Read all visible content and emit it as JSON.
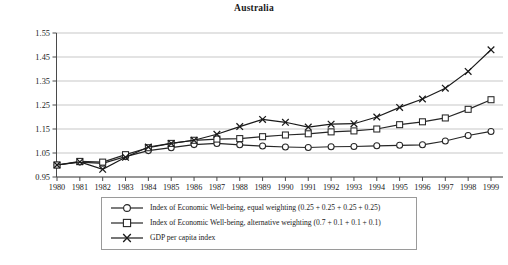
{
  "chart_data": {
    "type": "line",
    "title": "Australia",
    "xlabel": "",
    "ylabel": "",
    "x": [
      1980,
      1981,
      1982,
      1983,
      1984,
      1985,
      1986,
      1987,
      1988,
      1989,
      1990,
      1991,
      1992,
      1993,
      1994,
      1995,
      1996,
      1997,
      1998,
      1999
    ],
    "xtick_labels": [
      "1980",
      "1981",
      "1982",
      "1983",
      "1984",
      "1985",
      "1986",
      "1987",
      "1988",
      "1989",
      "1990",
      "1991",
      "1992",
      "1993",
      "1994",
      "1995",
      "1996",
      "1997",
      "1998",
      "1999"
    ],
    "ytick_labels": [
      "0.95",
      "1.05",
      "1.15",
      "1.25",
      "1.35",
      "1.45",
      "1.55"
    ],
    "ytick_values": [
      0.95,
      1.05,
      1.15,
      1.25,
      1.35,
      1.45,
      1.55
    ],
    "ylim": [
      0.95,
      1.55
    ],
    "xlim": [
      1980,
      1999
    ],
    "grid": "horizontal",
    "legend_position": "below-center",
    "series": [
      {
        "name": "Index of Economic Well-being, equal weighting (0.25 + 0.25 + 0.25 + 0.25)",
        "marker": "circle",
        "color": "#262626",
        "values": [
          1.0,
          1.012,
          1.007,
          1.035,
          1.06,
          1.072,
          1.085,
          1.09,
          1.084,
          1.079,
          1.075,
          1.073,
          1.076,
          1.077,
          1.08,
          1.082,
          1.084,
          1.1,
          1.123,
          1.14
        ]
      },
      {
        "name": "Index of Economic Well-being, alternative weighting (0.7 + 0.1 + 0.1 + 0.1)",
        "marker": "square",
        "color": "#262626",
        "values": [
          1.0,
          1.015,
          1.012,
          1.043,
          1.072,
          1.09,
          1.103,
          1.108,
          1.11,
          1.118,
          1.125,
          1.13,
          1.138,
          1.142,
          1.15,
          1.168,
          1.18,
          1.196,
          1.232,
          1.272
        ]
      },
      {
        "name": "GDP per capita index",
        "marker": "cross",
        "color": "#1a1a1a",
        "values": [
          1.0,
          1.013,
          0.982,
          1.032,
          1.075,
          1.09,
          1.103,
          1.128,
          1.16,
          1.19,
          1.178,
          1.158,
          1.17,
          1.172,
          1.2,
          1.24,
          1.275,
          1.32,
          1.39,
          1.48
        ]
      }
    ]
  },
  "legend": {
    "items": [
      {
        "label": "Index of Economic Well-being, equal weighting (0.25 + 0.25 + 0.25 + 0.25)",
        "marker": "circle"
      },
      {
        "label": "Index of Economic Well-being, alternative weighting (0.7 + 0.1 + 0.1 + 0.1)",
        "marker": "square"
      },
      {
        "label": "GDP per capita index",
        "marker": "cross"
      }
    ]
  }
}
